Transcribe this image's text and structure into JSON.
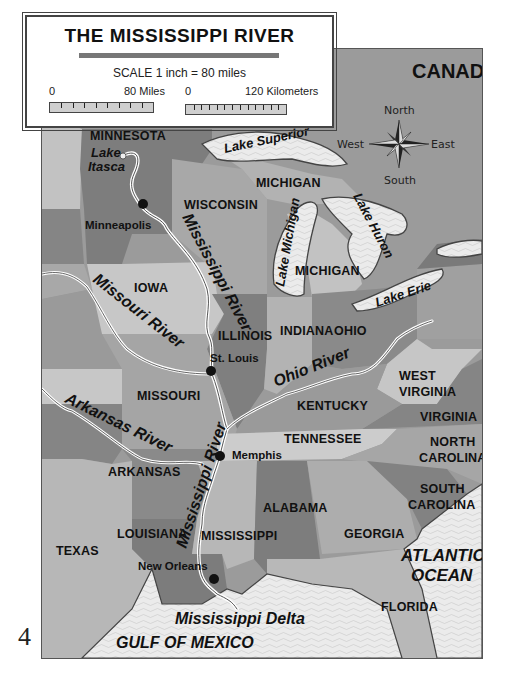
{
  "title": "THE MISSISSIPPI RIVER",
  "scale": {
    "text": "SCALE  1 inch = 80 miles",
    "miles": {
      "start": "0",
      "end": "80 Miles",
      "ticks": 8
    },
    "km": {
      "start": "0",
      "end": "120 Kilometers",
      "ticks": 12
    }
  },
  "compass": {
    "north": "North",
    "south": "South",
    "east": "East",
    "west": "West"
  },
  "page_number": "4",
  "colors": {
    "water": "#e9e9e9",
    "canada": "#9a9a9a",
    "light_state": "#c4c4c4",
    "mid_state": "#a9a9a9",
    "dark_state": "#7f7f7f",
    "river": "#ffffff",
    "border": "#3a3a3a"
  },
  "regions": {
    "canada": "CANADA",
    "states": {
      "minnesota": "MINNESOTA",
      "wisconsin": "WISCONSIN",
      "michigan_upper": "MICHIGAN",
      "michigan_lower": "MICHIGAN",
      "iowa": "IOWA",
      "illinois": "ILLINOIS",
      "indiana": "INDIANA",
      "ohio": "OHIO",
      "missouri": "MISSOURI",
      "kentucky": "KENTUCKY",
      "west_virginia_1": "WEST",
      "west_virginia_2": "VIRGINIA",
      "virginia": "VIRGINIA",
      "tennessee": "TENNESSEE",
      "north_carolina_1": "NORTH",
      "north_carolina_2": "CAROLINA",
      "arkansas": "ARKANSAS",
      "south_carolina_1": "SOUTH",
      "south_carolina_2": "CAROLINA",
      "alabama": "ALABAMA",
      "georgia": "GEORGIA",
      "louisiana": "LOUISIANA",
      "mississippi": "MISSISSIPPI",
      "texas": "TEXAS",
      "florida": "FLORIDA"
    },
    "water": {
      "lake_itasca_1": "Lake",
      "lake_itasca_2": "Itasca",
      "lake_superior": "Lake Superior",
      "lake_michigan": "Lake Michigan",
      "lake_huron": "Lake Huron",
      "lake_erie": "Lake Erie",
      "atlantic_1": "ATLANTIC",
      "atlantic_2": "OCEAN",
      "gulf": "GULF OF MEXICO",
      "delta": "Mississippi Delta"
    },
    "rivers": {
      "mississippi_upper": "Mississippi River",
      "mississippi_lower": "Mississippi River",
      "missouri": "Missouri River",
      "ohio": "Ohio River",
      "arkansas": "Arkansas River"
    },
    "cities": {
      "minneapolis": "Minneapolis",
      "st_louis": "St. Louis",
      "memphis": "Memphis",
      "new_orleans": "New Orleans"
    }
  }
}
